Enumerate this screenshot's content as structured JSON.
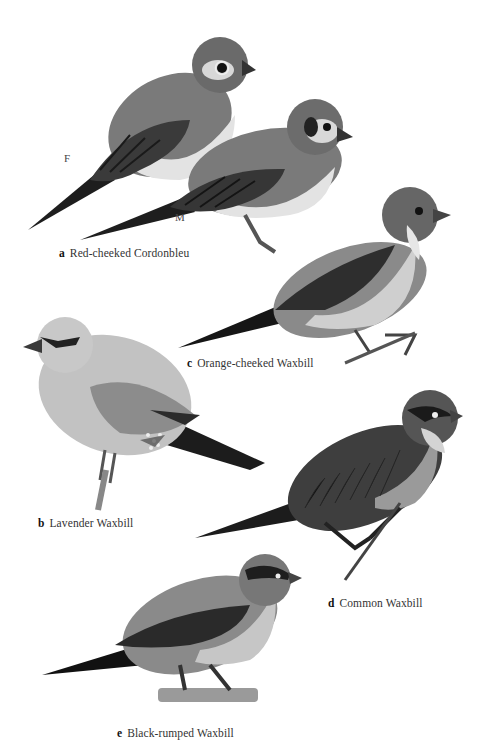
{
  "plate": {
    "description": "Field-guide illustration plate of waxbills (black-and-white)",
    "species": [
      {
        "letter": "a",
        "name": "Red-cheeked Cordonbleu",
        "sexes": [
          "F",
          "M"
        ]
      },
      {
        "letter": "b",
        "name": "Lavender Waxbill"
      },
      {
        "letter": "c",
        "name": "Orange-cheeked Waxbill"
      },
      {
        "letter": "d",
        "name": "Common Waxbill"
      },
      {
        "letter": "e",
        "name": "Black-rumped Waxbill"
      }
    ],
    "sex_labels": {
      "female": "F",
      "male": "M"
    }
  },
  "colors": {
    "background": "#ffffff",
    "dark_plumage": "#2b2b2b",
    "mid_plumage": "#6e6e6e",
    "light_plumage": "#c9c9c9",
    "pale_underparts": "#e2e2e2"
  }
}
